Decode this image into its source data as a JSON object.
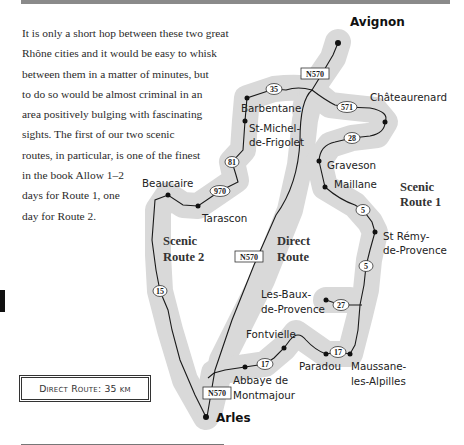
{
  "intro": {
    "lines": [
      "It is only a short hop between these two great",
      "Rhône cities and it would be easy to whisk",
      "between them in a matter of minutes, but",
      "to do so would be almost criminal in an",
      "area positively bulging with fascinating",
      "sights. The first of our two scenic",
      "routes, in particular, is one of the finest",
      "in the book Allow 1–2",
      "days for Route 1, one",
      "day for Route 2."
    ]
  },
  "distance_box": {
    "label": "Direct Route: 35 km"
  },
  "map": {
    "cities": {
      "north": "Avignon",
      "south": "Arles"
    },
    "route_labels": {
      "scenic1": [
        "Scenic",
        "Route 1"
      ],
      "scenic2": [
        "Scenic",
        "Route 2"
      ],
      "direct": [
        "Direct",
        "Route"
      ]
    },
    "places": {
      "barbentane": "Barbentane",
      "st_michel_1": "St-Michel-",
      "st_michel_2": "de-Frigolet",
      "beaucaire": "Beaucaire",
      "tarascon": "Tarascon",
      "chateaurenard": "Châteaurenard",
      "graveson": "Graveson",
      "maillane": "Maillane",
      "st_remy_1": "St Rémy-",
      "st_remy_2": "de-Provence",
      "les_baux_1": "Les-Baux-",
      "les_baux_2": "de-Provence",
      "fontvielle": "Fontvielle",
      "paradou": "Paradou",
      "maussane_1": "Maussane-",
      "maussane_2": "les-Alpilles",
      "abbaye_1": "Abbaye de",
      "abbaye_2": "Montmajour"
    },
    "roads": {
      "n570_top": "N570",
      "n570_mid": "N570",
      "n570_bottom": "N570",
      "r35": "35",
      "r571": "571",
      "r28": "28",
      "r81": "81",
      "r970": "970",
      "r5_a": "5",
      "r5_b": "5",
      "r27": "27",
      "r17_a": "17",
      "r17_b": "17",
      "r15": "15"
    }
  },
  "colors": {
    "halo": "#d9d9d9",
    "road": "#1a1a1a",
    "text": "#222222",
    "top_bar": "#8a8a8a"
  }
}
